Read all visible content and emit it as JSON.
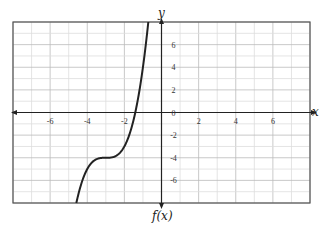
{
  "chart_data": {
    "type": "line",
    "title": "",
    "caption": "f(x)",
    "xlabel": "x",
    "ylabel": "y",
    "xlim": [
      -8,
      8
    ],
    "ylim": [
      -8,
      8
    ],
    "grid": true,
    "x_ticks": [
      -6,
      -4,
      -2,
      2,
      4,
      6
    ],
    "y_ticks": [
      6,
      4,
      2,
      0,
      -2,
      -4,
      -6
    ],
    "series": [
      {
        "name": "f(x)",
        "description": "increasing cubic with flat inflection near (-3, -4)",
        "x": [
          -4.59,
          -4.5,
          -4.0,
          -3.5,
          -3.0,
          -2.5,
          -2.0,
          -1.5,
          -1.0,
          -0.71
        ],
        "y": [
          -8.0,
          -7.4,
          -5.0,
          -4.1,
          -4.0,
          -3.9,
          -3.0,
          -0.6,
          4.0,
          8.0
        ]
      }
    ],
    "color": "#222222"
  },
  "labels": {
    "x_axis": "x",
    "y_axis": "y",
    "caption": "f(x)",
    "origin": "0"
  }
}
